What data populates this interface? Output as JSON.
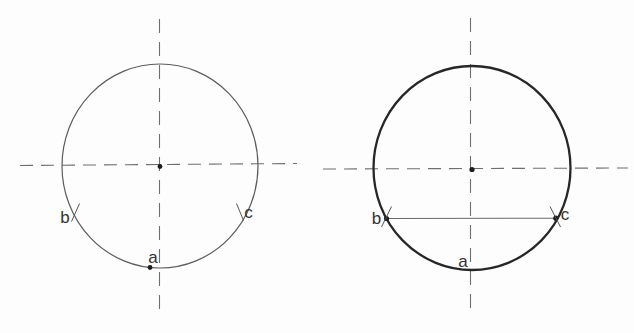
{
  "diagram": {
    "background": "#fdfdfd",
    "colors": {
      "thin_circle_stroke": "#5c5c5c",
      "thick_circle_stroke": "#272727",
      "centerline_stroke": "#6f6f6f",
      "chord_stroke": "#6a6a6a",
      "tick_stroke": "#555555",
      "dot_fill": "#1d1d1d",
      "label_color": "#333333"
    },
    "left": {
      "description": "thin-lined circle with dashed centerlines, center dot, point a on bottom of circle, tick marks at points b and c",
      "labels": {
        "a": "a",
        "b": "b",
        "c": "c"
      }
    },
    "right": {
      "description": "thick-lined circle with dashed centerlines, center dot, chord drawn from b to c, point a label at bottom",
      "labels": {
        "a": "a",
        "b": "b",
        "c": "c"
      }
    }
  }
}
